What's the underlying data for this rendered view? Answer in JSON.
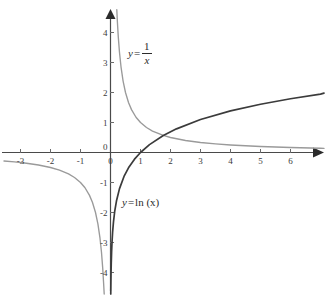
{
  "chart_data": {
    "type": "line",
    "title": "",
    "subtitle": "",
    "xlabel": "",
    "ylabel": "",
    "xlim": [
      -3.6,
      7.3
    ],
    "ylim": [
      -4.8,
      4.8
    ],
    "grid": false,
    "legend_position": "inline-annotations",
    "x_ticks": [
      -3,
      -2,
      -1,
      0,
      1,
      2,
      3,
      4,
      5,
      6
    ],
    "y_ticks": [
      -4,
      -3,
      -2,
      -1,
      0,
      1,
      2,
      3,
      4
    ],
    "x_tick_labels": [
      "-3",
      "-2",
      "-1",
      "0",
      "1",
      "2",
      "3",
      "4",
      "5",
      "6"
    ],
    "y_tick_labels": [
      "-4",
      "-3",
      "-2",
      "-1",
      "0",
      "1",
      "2",
      "3",
      "4"
    ],
    "origin_label": "0",
    "series": [
      {
        "name": "y = 1/x",
        "expression": "1/x",
        "color": "#9a9a9a",
        "annotation": {
          "lhs": "y",
          "equals": "=",
          "numerator": "1",
          "denominator": "x"
        },
        "branches": [
          {
            "name": "left-branch",
            "x": [
              -3.55,
              -3.2,
              -2.8,
              -2.4,
              -2.0,
              -1.7,
              -1.4,
              -1.2,
              -1.0,
              -0.85,
              -0.7,
              -0.6,
              -0.5,
              -0.42,
              -0.35,
              -0.3,
              -0.26,
              -0.23,
              -0.21
            ],
            "y": [
              -0.282,
              -0.313,
              -0.357,
              -0.417,
              -0.5,
              -0.588,
              -0.714,
              -0.833,
              -1.0,
              -1.176,
              -1.429,
              -1.667,
              -2.0,
              -2.381,
              -2.857,
              -3.333,
              -3.846,
              -4.348,
              -4.76
            ]
          },
          {
            "name": "right-branch",
            "x": [
              0.21,
              0.23,
              0.26,
              0.3,
              0.35,
              0.42,
              0.5,
              0.6,
              0.7,
              0.85,
              1.0,
              1.2,
              1.4,
              1.76,
              2.0,
              2.5,
              3.0,
              3.5,
              4.0,
              5.0,
              6.0,
              7.0,
              7.25
            ],
            "y": [
              4.76,
              4.348,
              3.846,
              3.333,
              2.857,
              2.381,
              2.0,
              1.667,
              1.429,
              1.176,
              1.0,
              0.833,
              0.714,
              0.568,
              0.5,
              0.4,
              0.333,
              0.286,
              0.25,
              0.2,
              0.167,
              0.143,
              0.138
            ]
          }
        ]
      },
      {
        "name": "y = ln (x)",
        "expression": "ln(x)",
        "color": "#3b3b3b",
        "annotation": {
          "lhs": "y",
          "equals": "=",
          "rhs": "ln (x)"
        },
        "branches": [
          {
            "name": "main",
            "x": [
              0.0087,
              0.012,
              0.018,
              0.025,
              0.037,
              0.05,
              0.07,
              0.1,
              0.14,
              0.2,
              0.3,
              0.45,
              0.6,
              0.8,
              1.0,
              1.3,
              1.76,
              2.2,
              3.0,
              4.0,
              5.0,
              6.0,
              7.0,
              7.25
            ],
            "y": [
              -4.74,
              -4.42,
              -4.02,
              -3.69,
              -3.3,
              -3.0,
              -2.66,
              -2.303,
              -1.966,
              -1.609,
              -1.204,
              -0.799,
              -0.511,
              -0.223,
              0.0,
              0.262,
              0.565,
              0.788,
              1.099,
              1.386,
              1.609,
              1.792,
              1.946,
              1.981
            ]
          }
        ]
      }
    ],
    "annotations": [
      {
        "name": "label-reciprocal",
        "text": "y = 1/x",
        "x_px": 128,
        "y_px": 48
      },
      {
        "name": "label-natural-log",
        "text": "y = ln (x)",
        "x_px": 122,
        "y_px": 203
      }
    ],
    "axis_style": {
      "axis_color": "#4a4a4a",
      "arrow_color": "#2b2b2b",
      "tick_color": "#6a6a6a",
      "background": "#ffffff"
    }
  }
}
